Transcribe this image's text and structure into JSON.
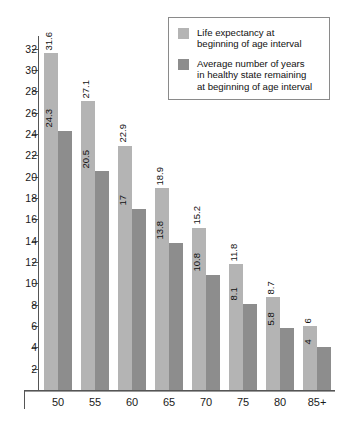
{
  "chart_data": {
    "type": "bar",
    "title": "",
    "subtitle": "",
    "xlabel": "",
    "ylabel": "",
    "categories": [
      "50",
      "55",
      "60",
      "65",
      "70",
      "75",
      "80",
      "85+"
    ],
    "series": [
      {
        "name": "Life expectancy at beginning of age interval",
        "color": "#b4b4b4",
        "values": [
          31.6,
          27.1,
          22.9,
          18.9,
          15.2,
          11.8,
          8.7,
          6
        ],
        "labels": [
          "31.6",
          "27.1",
          "22.9",
          "18.9",
          "15.2",
          "11.8",
          "8.7",
          "6"
        ]
      },
      {
        "name": "Average number of years in healthy state remaining at beginning of age interval",
        "color": "#8d8d8d",
        "values": [
          24.3,
          20.5,
          17,
          13.8,
          10.8,
          8.1,
          5.8,
          4
        ],
        "labels": [
          "24.3",
          "20.5",
          "17",
          "13.8",
          "10.8",
          "8.1",
          "5.8",
          "4"
        ]
      }
    ],
    "ylim": [
      0,
      33.2
    ],
    "yticks": [
      2,
      4,
      6,
      8,
      10,
      12,
      14,
      16,
      18,
      20,
      22,
      24,
      26,
      28,
      30,
      32
    ],
    "ytick_labels": [
      "2",
      "4",
      "6",
      "8",
      "10",
      "12",
      "14",
      "16",
      "18",
      "20",
      "22",
      "24",
      "26",
      "28",
      "30",
      "32"
    ],
    "grid": false,
    "legend_position": "top-right",
    "data_label_rotation": "vertical"
  },
  "legend": {
    "entries": [
      {
        "swatch": "light-gray-swatch",
        "text": "Life expectancy at\nbeginning of age interval"
      },
      {
        "swatch": "dark-gray-swatch",
        "text": "Average number of years\nin healthy state remaining\nat beginning of age interval"
      }
    ]
  }
}
